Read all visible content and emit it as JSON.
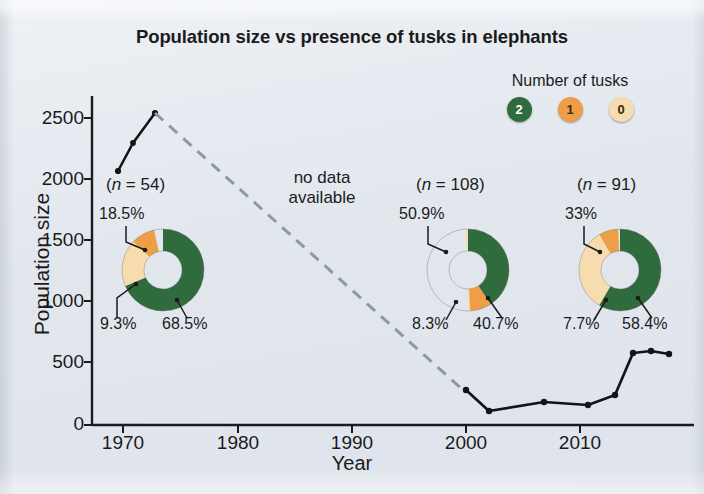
{
  "title": "Population size vs presence of tusks in elephants",
  "legend": {
    "title": "Number of tusks",
    "items": [
      {
        "label": "2",
        "color": "#2f6b3c",
        "text_color": "#ffffff"
      },
      {
        "label": "1",
        "color": "#ee9e46",
        "text_color": "#3a2a12"
      },
      {
        "label": "0",
        "color": "#f6dcae",
        "text_color": "#3a2a12"
      }
    ]
  },
  "annotations": {
    "no_data": "no data available",
    "no_data_line1": "no data",
    "no_data_line2": "available"
  },
  "donuts": [
    {
      "n_label": "(n = 54)",
      "n": 54,
      "year": 1972,
      "slices": [
        {
          "tusks": "2",
          "pct": "68.5%",
          "value": 68.5,
          "color": "#2f6b3c"
        },
        {
          "tusks": "0",
          "pct": "18.5%",
          "value": 18.5,
          "color": "#f6dcae"
        },
        {
          "tusks": "1",
          "pct": "9.3%",
          "value": 9.3,
          "color": "#ee9e46"
        }
      ]
    },
    {
      "n_label": "(n = 108)",
      "n": 108,
      "year": 2001,
      "slices": [
        {
          "tusks": "2",
          "pct": "40.7%",
          "value": 40.7,
          "color": "#2f6b3c"
        },
        {
          "tusks": "0",
          "pct": "50.9%",
          "value": 50.9,
          "color": "#f6dcae"
        },
        {
          "tusks": "1",
          "pct": "8.3%",
          "value": 8.3,
          "color": "#ee9e46"
        }
      ]
    },
    {
      "n_label": "(n = 91)",
      "n": 91,
      "year": 2014,
      "slices": [
        {
          "tusks": "2",
          "pct": "58.4%",
          "value": 58.4,
          "color": "#2f6b3c"
        },
        {
          "tusks": "0",
          "pct": "33%",
          "value": 33.0,
          "color": "#f6dcae"
        },
        {
          "tusks": "1",
          "pct": "7.7%",
          "value": 7.7,
          "color": "#ee9e46"
        }
      ]
    }
  ],
  "chart_data": {
    "type": "line",
    "title": "Population size vs presence of tusks in elephants",
    "xlabel": "Year",
    "ylabel": "Population size",
    "xlim": [
      1967,
      2018
    ],
    "ylim": [
      0,
      2700
    ],
    "xticks": [
      1970,
      1980,
      1990,
      2000,
      2010
    ],
    "yticks": [
      0,
      500,
      1000,
      1500,
      2000,
      2500
    ],
    "grid": false,
    "legend_position": "top-right",
    "series": [
      {
        "name": "Population size (observed, early)",
        "style": "solid",
        "color": "#141414",
        "points": [
          {
            "x": 1969.5,
            "y": 2050
          },
          {
            "x": 1971.0,
            "y": 2280
          },
          {
            "x": 1972.8,
            "y": 2530
          }
        ]
      },
      {
        "name": "no data available (interpolated)",
        "style": "dashed",
        "color": "#8d98a8",
        "points": [
          {
            "x": 1972.8,
            "y": 2530
          },
          {
            "x": 2000.0,
            "y": 230
          }
        ]
      },
      {
        "name": "Population size (observed, recent)",
        "style": "solid",
        "color": "#141414",
        "points": [
          {
            "x": 2000.0,
            "y": 230
          },
          {
            "x": 2002.0,
            "y": 110
          },
          {
            "x": 2006.8,
            "y": 185
          },
          {
            "x": 2010.6,
            "y": 165
          },
          {
            "x": 2013.0,
            "y": 250
          },
          {
            "x": 2014.6,
            "y": 565
          },
          {
            "x": 2016.2,
            "y": 580
          },
          {
            "x": 2017.6,
            "y": 560
          }
        ]
      }
    ],
    "donut_insets": [
      {
        "n_label": "(n = 54)",
        "n": 54,
        "categories": [
          "2 tusks",
          "1 tusk",
          "0 tusks"
        ],
        "values": [
          68.5,
          9.3,
          18.5
        ],
        "labels": [
          "68.5%",
          "9.3%",
          "18.5%"
        ]
      },
      {
        "n_label": "(n = 108)",
        "n": 108,
        "categories": [
          "2 tusks",
          "1 tusk",
          "0 tusks"
        ],
        "values": [
          40.7,
          8.3,
          50.9
        ],
        "labels": [
          "40.7%",
          "8.3%",
          "50.9%"
        ]
      },
      {
        "n_label": "(n = 91)",
        "n": 91,
        "categories": [
          "2 tusks",
          "1 tusk",
          "0 tusks"
        ],
        "values": [
          58.4,
          7.7,
          33.0
        ],
        "labels": [
          "58.4%",
          "7.7%",
          "33%"
        ]
      }
    ]
  },
  "axes": {
    "ylabel": "Population size",
    "xlabel": "Year",
    "yticks": [
      "2500",
      "2000",
      "1500",
      "1000",
      "500",
      "0"
    ],
    "xticks": [
      "1970",
      "1980",
      "1990",
      "2000",
      "2010"
    ]
  }
}
